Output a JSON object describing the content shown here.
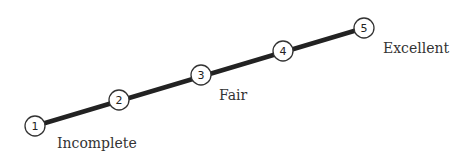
{
  "diagram": {
    "type": "rating-scale",
    "line_color": "#222222",
    "nodes": [
      {
        "label": "1",
        "x": 35,
        "y": 126
      },
      {
        "label": "2",
        "x": 119,
        "y": 100
      },
      {
        "label": "3",
        "x": 201,
        "y": 75
      },
      {
        "label": "4",
        "x": 283,
        "y": 51
      },
      {
        "label": "5",
        "x": 364,
        "y": 28
      }
    ],
    "labels": {
      "low": "Incomplete",
      "mid": "Fair",
      "high": "Excellent"
    }
  }
}
